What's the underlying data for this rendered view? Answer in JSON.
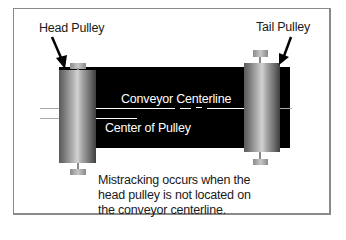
{
  "diagram": {
    "labels": {
      "head_pulley": "Head Pulley",
      "tail_pulley": "Tail Pulley",
      "conveyor_centerline": "Conveyor Centerline",
      "center_of_pulley": "Center of Pulley"
    },
    "caption_lines": [
      "Mistracking occurs when the",
      "head pulley is not located on",
      "the conveyor centerline."
    ],
    "colors": {
      "belt": "#000000",
      "frame": "#8a8a8a",
      "text": "#1a1a1a",
      "belt_text": "#ffffff"
    }
  }
}
